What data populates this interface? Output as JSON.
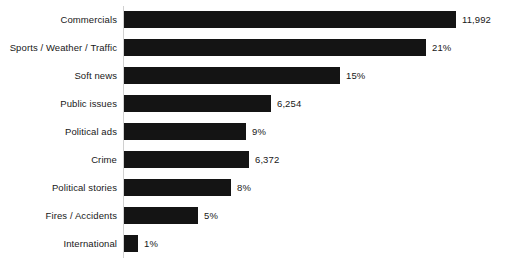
{
  "chart_data": {
    "type": "bar",
    "orientation": "horizontal",
    "title": "",
    "subtitle": "",
    "xlabel": "",
    "ylabel": "",
    "grid": false,
    "legend": false,
    "axis_line_color": "#d0d0d0",
    "bar_color": "#141414",
    "background_color": "#ffffff",
    "label_color": "#181818",
    "xlim": [
      0,
      24
    ],
    "categories": [
      "Commercials",
      "Sports / Weather / Traffic",
      "Soft news",
      "Public issues",
      "Political ads",
      "Crime",
      "Political stories",
      "Fires / Accidents",
      "International"
    ],
    "values": [
      23,
      21,
      15,
      10.2,
      8.5,
      8.7,
      7.4,
      5.1,
      1
    ],
    "data_labels": [
      "11,992",
      "21%",
      "15%",
      "6,254",
      "9%",
      "6,372",
      "8%",
      "5%",
      "1%"
    ],
    "bars": [
      {
        "category": "Commercials",
        "label": "11,992",
        "bar_px": 332
      },
      {
        "category": "Sports / Weather / Traffic",
        "label": "21%",
        "bar_px": 302
      },
      {
        "category": "Soft news",
        "label": "15%",
        "bar_px": 216
      },
      {
        "category": "Public issues",
        "label": "6,254",
        "bar_px": 147
      },
      {
        "category": "Political ads",
        "label": "9%",
        "bar_px": 122
      },
      {
        "category": "Crime",
        "label": "6,372",
        "bar_px": 125
      },
      {
        "category": "Political stories",
        "label": "8%",
        "bar_px": 107
      },
      {
        "category": "Fires / Accidents",
        "label": "5%",
        "bar_px": 74
      },
      {
        "category": "International",
        "label": "1%",
        "bar_px": 14
      }
    ]
  }
}
